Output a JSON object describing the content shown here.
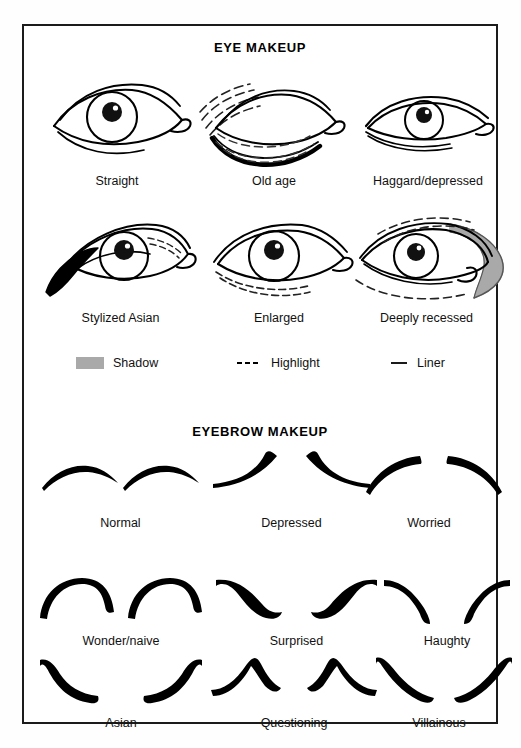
{
  "document": {
    "title": "Eye and Eyebrow Makeup Chart",
    "border_color": "#1b1b1b",
    "background_color": "#ffffff",
    "ink_color": "#000000",
    "shadow_color": "#a9a9a9"
  },
  "sections": [
    {
      "id": "eye-makeup",
      "heading": "EYE MAKEUP",
      "rows": [
        {
          "items": [
            {
              "name": "straight",
              "caption": "Straight"
            },
            {
              "name": "old-age",
              "caption": "Old age"
            },
            {
              "name": "haggard-depressed",
              "caption": "Haggard/depressed"
            }
          ]
        },
        {
          "items": [
            {
              "name": "stylized-asian",
              "caption": "Stylized Asian"
            },
            {
              "name": "enlarged",
              "caption": "Enlarged"
            },
            {
              "name": "deeply-recessed",
              "caption": "Deeply recessed"
            }
          ]
        }
      ],
      "legend": [
        {
          "name": "shadow",
          "label": "Shadow",
          "symbol": "filled-gray-swatch",
          "color": "#a9a9a9"
        },
        {
          "name": "highlight",
          "label": "Highlight",
          "symbol": "dashed-line",
          "color": "#000000"
        },
        {
          "name": "liner",
          "label": "Liner",
          "symbol": "solid-line",
          "color": "#000000"
        }
      ]
    },
    {
      "id": "eyebrow-makeup",
      "heading": "EYEBROW MAKEUP",
      "rows": [
        {
          "items": [
            {
              "name": "normal",
              "caption": "Normal"
            },
            {
              "name": "depressed",
              "caption": "Depressed"
            },
            {
              "name": "worried",
              "caption": "Worried"
            }
          ]
        },
        {
          "items": [
            {
              "name": "wonder-naive",
              "caption": "Wonder/naive"
            },
            {
              "name": "surprised",
              "caption": "Surprised"
            },
            {
              "name": "haughty",
              "caption": "Haughty"
            }
          ]
        },
        {
          "items": [
            {
              "name": "asian",
              "caption": "Asian"
            },
            {
              "name": "questioning",
              "caption": "Questioning"
            },
            {
              "name": "villainous",
              "caption": "Villainous"
            }
          ]
        }
      ]
    }
  ]
}
